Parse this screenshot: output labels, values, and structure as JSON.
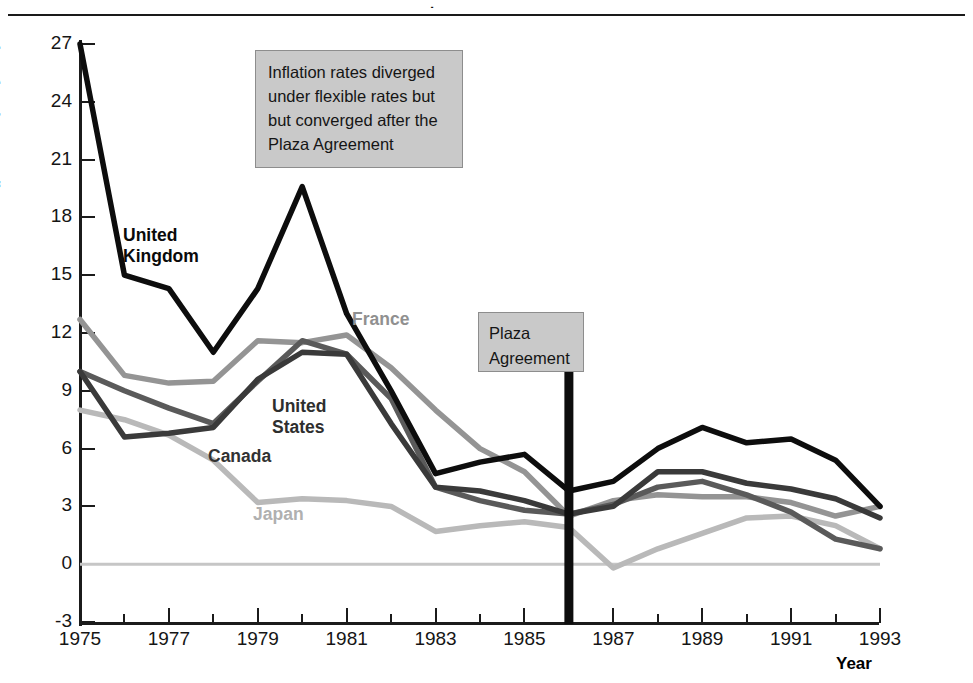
{
  "figure": {
    "title_fragment": ".",
    "axis_title_y": "Inflation rate (percent per year)",
    "axis_title_x": "Year"
  },
  "annotations": {
    "diverged": "Inflation rates diverged under flexible rates but but converged after the Plaza Agreement",
    "plaza_label": "Plaza Agreement",
    "plaza_marker_year": 1986
  },
  "series_labels": {
    "united_kingdom": "United\nKingdom",
    "united_states": "United\nStates",
    "canada": "Canada",
    "france": "France",
    "japan": "Japan"
  },
  "colors": {
    "united_kingdom": "#0d0d0d",
    "united_states": "#3a3a3a",
    "canada": "#5a5a5a",
    "france": "#949494",
    "japan": "#b9b9b9",
    "zero_line": "#c6c6c6",
    "plaza_marker": "#0d0d0d",
    "note_fill": "#c9c9c9",
    "note_border": "#8d8d8d",
    "axis": "#1b1b1b"
  },
  "chart_data": {
    "type": "line",
    "title": "Inflation rates diverged under flexible rates but but converged after the Plaza Agreement",
    "xlabel": "Year",
    "ylabel": "Inflation rate (percent per year)",
    "xlim": [
      1975,
      1993
    ],
    "ylim": [
      -3,
      27
    ],
    "yticks": [
      -3,
      0,
      3,
      6,
      9,
      12,
      15,
      18,
      21,
      24,
      27
    ],
    "xticks": [
      1975,
      1977,
      1979,
      1981,
      1983,
      1985,
      1987,
      1989,
      1991,
      1993
    ],
    "xticks_minor": [
      1976,
      1978,
      1980,
      1982,
      1984,
      1986,
      1988,
      1990,
      1992
    ],
    "grid": false,
    "legend": "inline-labels",
    "x": [
      1975,
      1976,
      1977,
      1978,
      1979,
      1980,
      1981,
      1982,
      1983,
      1984,
      1985,
      1986,
      1987,
      1988,
      1989,
      1990,
      1991,
      1992,
      1993
    ],
    "series": [
      {
        "name": "United Kingdom",
        "color": "#0d0d0d",
        "values": [
          27.0,
          15.0,
          14.3,
          11.0,
          14.3,
          19.6,
          13.0,
          9.0,
          4.7,
          5.3,
          5.7,
          3.8,
          4.3,
          6.0,
          7.1,
          6.3,
          6.5,
          5.4,
          3.0
        ]
      },
      {
        "name": "United States",
        "color": "#3a3a3a",
        "values": [
          10.0,
          6.6,
          6.8,
          7.1,
          9.6,
          11.0,
          10.9,
          7.3,
          4.0,
          3.8,
          3.3,
          2.6,
          3.0,
          4.8,
          4.8,
          4.2,
          3.9,
          3.4,
          2.4
        ]
      },
      {
        "name": "Canada",
        "color": "#5a5a5a",
        "values": [
          10.0,
          9.0,
          8.1,
          7.3,
          9.5,
          11.6,
          10.9,
          8.6,
          4.0,
          3.3,
          2.8,
          2.6,
          3.1,
          4.0,
          4.3,
          3.6,
          2.7,
          1.3,
          0.8
        ]
      },
      {
        "name": "France",
        "color": "#949494",
        "values": [
          12.7,
          9.8,
          9.4,
          9.5,
          11.6,
          11.5,
          11.9,
          10.2,
          8.0,
          6.0,
          4.8,
          2.5,
          3.3,
          3.6,
          3.5,
          3.5,
          3.2,
          2.5,
          3.0
        ]
      },
      {
        "name": "Japan",
        "color": "#b9b9b9",
        "values": [
          8.0,
          7.5,
          6.7,
          5.4,
          3.2,
          3.4,
          3.3,
          3.0,
          1.7,
          2.0,
          2.2,
          1.9,
          -0.2,
          0.8,
          1.6,
          2.4,
          2.5,
          2.0,
          0.8
        ]
      }
    ],
    "markers": [
      {
        "type": "vline",
        "x": 1986,
        "label": "Plaza Agreement",
        "color": "#0d0d0d"
      },
      {
        "type": "hline",
        "y": 0,
        "color": "#c6c6c6"
      }
    ]
  }
}
